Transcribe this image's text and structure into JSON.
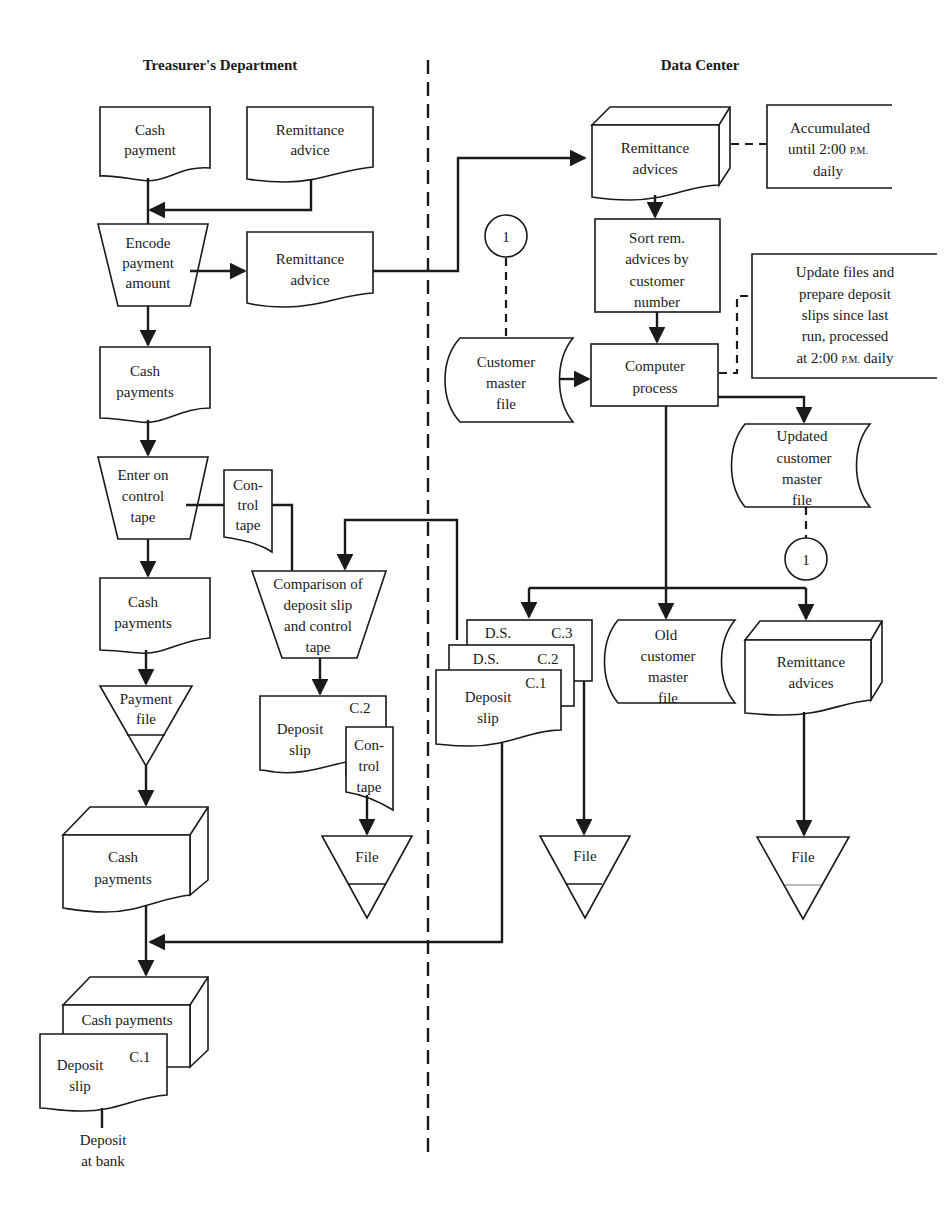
{
  "lanes": {
    "left_title": "Treasurer's Department",
    "right_title": "Data Center"
  },
  "treasurer": {
    "cash_payment_doc": [
      "Cash",
      "payment"
    ],
    "remittance_advice_doc": [
      "Remittance",
      "advice"
    ],
    "encode_op": [
      "Encode",
      "payment",
      "amount"
    ],
    "remittance_advice_out": [
      "Remittance",
      "advice"
    ],
    "cash_payments_doc1": [
      "Cash",
      "payments"
    ],
    "enter_control_op": [
      "Enter on",
      "control",
      "tape"
    ],
    "control_tape_doc": [
      "Con-",
      "trol",
      "tape"
    ],
    "cash_payments_doc2": [
      "Cash",
      "payments"
    ],
    "payment_file": [
      "Payment",
      "file"
    ],
    "comparison_op": [
      "Comparison of",
      "deposit slip",
      "and control",
      "tape"
    ],
    "deposit_slip_c2": {
      "lines": [
        "Deposit",
        "slip"
      ],
      "copy": "C.2"
    },
    "control_tape_doc2": [
      "Con-",
      "trol",
      "tape"
    ],
    "file_1": "File",
    "cash_payments_batch": [
      "Cash",
      "payments"
    ],
    "cash_payments_final": "Cash payments",
    "deposit_slip_final": {
      "lines": [
        "Deposit",
        "slip"
      ],
      "copy": "C.1"
    },
    "deposit_at_bank": [
      "Deposit",
      "at bank"
    ]
  },
  "datacenter": {
    "remittance_advices_batch": [
      "Remittance",
      "advices"
    ],
    "accumulated_note": {
      "line1": "Accumulated",
      "line2_pre": "until 2:00 ",
      "line2_pm": "P.M.",
      "line3": "daily"
    },
    "connector_top": "1",
    "sort_op": [
      "Sort rem.",
      "advices by",
      "customer",
      "number"
    ],
    "update_note": {
      "l1": "Update files and",
      "l2": "prepare deposit",
      "l3": "slips since last",
      "l4": "run, processed",
      "l5_pre": "at 2:00 ",
      "l5_pm": "P.M.",
      "l5_post": " daily"
    },
    "customer_master_file": [
      "Customer",
      "master",
      "file"
    ],
    "computer_process": [
      "Computer",
      "process"
    ],
    "updated_master_file": [
      "Updated",
      "customer",
      "master",
      "file"
    ],
    "connector_bottom": "1",
    "deposit_slip_stack": {
      "c3": {
        "label": "D.S.",
        "copy": "C.3"
      },
      "c2": {
        "label": "D.S.",
        "copy": "C.2"
      },
      "c1": {
        "lines": [
          "Deposit",
          "slip"
        ],
        "copy": "C.1"
      }
    },
    "old_master_file": [
      "Old",
      "customer",
      "master",
      "file"
    ],
    "remittance_advices_out": [
      "Remittance",
      "advices"
    ],
    "file_2": "File",
    "file_3": "File"
  }
}
